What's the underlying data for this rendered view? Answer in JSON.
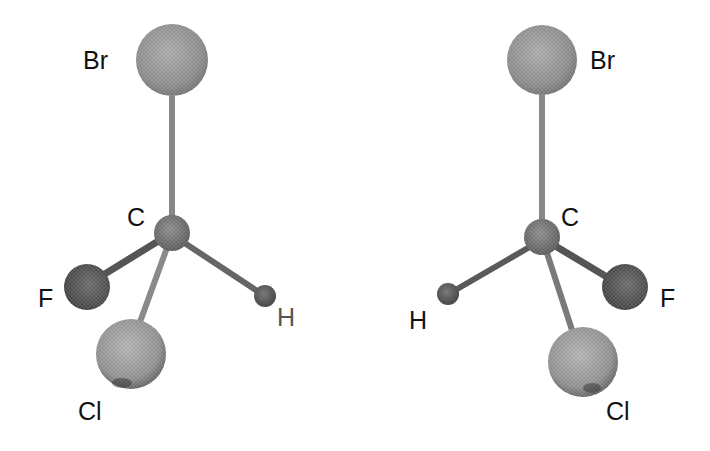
{
  "figure": {
    "molecules": [
      {
        "id": "left",
        "atoms": [
          {
            "symbol": "Br",
            "cx": 172,
            "cy": 60,
            "r": 36,
            "label_x": 83,
            "label_y": 69
          },
          {
            "symbol": "C",
            "cx": 172,
            "cy": 233,
            "r": 18,
            "label_x": 127,
            "label_y": 226
          },
          {
            "symbol": "F",
            "cx": 87,
            "cy": 287,
            "r": 23,
            "label_x": 38,
            "label_y": 307
          },
          {
            "symbol": "H",
            "cx": 265,
            "cy": 296,
            "r": 11,
            "label_x": 277,
            "label_y": 326
          },
          {
            "symbol": "Cl",
            "cx": 131,
            "cy": 354,
            "r": 35,
            "label_x": 78,
            "label_y": 420
          }
        ]
      },
      {
        "id": "right",
        "atoms": [
          {
            "symbol": "Br",
            "cx": 542,
            "cy": 60,
            "r": 35,
            "label_x": 590,
            "label_y": 69
          },
          {
            "symbol": "C",
            "cx": 542,
            "cy": 237,
            "r": 18,
            "label_x": 561,
            "label_y": 226
          },
          {
            "symbol": "F",
            "cx": 625,
            "cy": 287,
            "r": 23,
            "label_x": 660,
            "label_y": 307
          },
          {
            "symbol": "H",
            "cx": 448,
            "cy": 294,
            "r": 11,
            "label_x": 409,
            "label_y": 329
          },
          {
            "symbol": "Cl",
            "cx": 583,
            "cy": 362,
            "r": 35,
            "label_x": 606,
            "label_y": 420
          }
        ]
      }
    ],
    "labels": {
      "left_br": "Br",
      "left_c": "C",
      "left_f": "F",
      "left_h": "H",
      "left_cl": "Cl",
      "right_br": "Br",
      "right_c": "C",
      "right_f": "F",
      "right_h": "H",
      "right_cl": "Cl"
    },
    "colors": {
      "background": "#ffffff",
      "bond": "#7a7a7a",
      "bond_dark": "#555555",
      "br_sphere": "#8c8c8c",
      "c_sphere": "#6e6e6e",
      "f_sphere": "#4e4e4e",
      "h_sphere": "#606060",
      "cl_sphere": "#909090",
      "label": "#111111"
    }
  }
}
